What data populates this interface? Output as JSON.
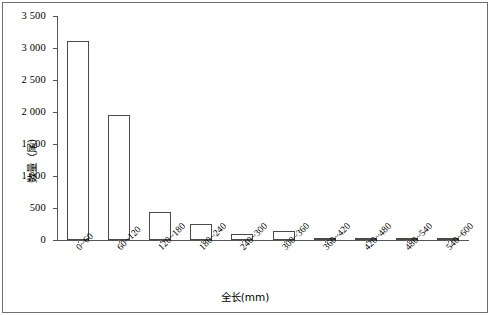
{
  "chart_data": {
    "type": "bar",
    "title": "",
    "subtitle": "",
    "xlabel": "全长(mm)",
    "ylabel": "数量（尾）",
    "categories": [
      "0~60",
      "60~120",
      "120~180",
      "180~240",
      "240~300",
      "300~360",
      "360~420",
      "420~480",
      "480~540",
      "540~600"
    ],
    "values": [
      3110,
      1950,
      430,
      250,
      100,
      140,
      30,
      15,
      12,
      8
    ],
    "series": [
      {
        "name": "数量（尾）",
        "values": [
          3110,
          1950,
          430,
          250,
          100,
          140,
          30,
          15,
          12,
          8
        ]
      }
    ],
    "ylim": [
      0,
      3500
    ],
    "ytick_values": [
      0,
      500,
      1000,
      1500,
      2000,
      2500,
      3000,
      3500
    ],
    "ytick_labels": [
      "0",
      "500",
      "1 000",
      "1 500",
      "2 000",
      "2 500",
      "3 000",
      "3 500"
    ],
    "grid": false,
    "legend": false,
    "legend_position": "none",
    "bar_fill_color": "#ffffff",
    "bar_edge_color": "#4a4a4a",
    "axis_color": "#555555",
    "background_color": "#ffffff"
  }
}
